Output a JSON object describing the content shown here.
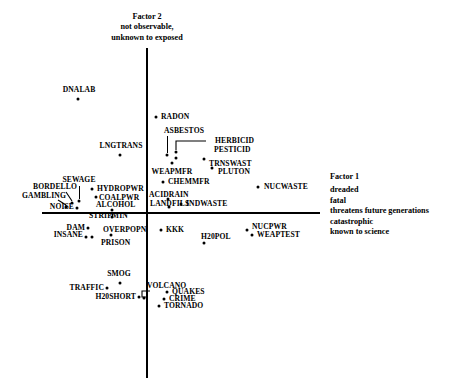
{
  "figure": {
    "type": "scatter",
    "background": "#ffffff",
    "point_color": "#000000",
    "axis_color": "#000000"
  },
  "axes": {
    "factor2": {
      "title": "Factor 2",
      "desc_line1": "not observable,",
      "desc_line2": "unknown to exposed",
      "orientation": "vertical",
      "x_px": 146,
      "y_top_px": 48,
      "y_bottom_px": 378
    },
    "factor1": {
      "title": "Factor 1",
      "desc_line1": "dreaded",
      "desc_line2": "fatal",
      "desc_line3": "threatens future generations",
      "desc_line4": "catastrophic",
      "desc_line5": "known to science",
      "orientation": "horizontal",
      "y_px": 212,
      "x_left_px": 42,
      "x_right_px": 320
    }
  },
  "chart_data": {
    "type": "scatter",
    "title": "",
    "subtitle": "",
    "xlabel": "Factor 1: dreaded, fatal, threatens future generations, catastrophic, known to science",
    "ylabel": "Factor 2: not observable, unknown to exposed",
    "grid": false,
    "legend": "none",
    "axis_origin_px": {
      "x": 146,
      "y": 212
    },
    "xlim_px": [
      42,
      320
    ],
    "ylim_px": [
      48,
      378
    ],
    "points": [
      {
        "label": "DNALAB",
        "px": 78,
        "py": 99,
        "lx": 79,
        "ly": 90,
        "anchor": "c",
        "leader": null
      },
      {
        "label": "RADON",
        "px": 156,
        "py": 117,
        "lx": 161,
        "ly": 117,
        "anchor": "l",
        "leader": null
      },
      {
        "label": "ASBESTOS",
        "px": 167,
        "py": 155,
        "lx": 184,
        "ly": 131,
        "anchor": "c",
        "leader": {
          "type": "v",
          "x": 167,
          "y1": 136,
          "y2": 153
        }
      },
      {
        "label": "HERBICID",
        "px": 176,
        "py": 152,
        "lx": 215,
        "ly": 141,
        "anchor": "l",
        "leader": {
          "type": "elbow-left",
          "x1": 206,
          "y1": 141,
          "x2": 176,
          "y2": 150
        }
      },
      {
        "label": "PESTICID",
        "px": 176,
        "py": 158,
        "lx": 214,
        "ly": 150,
        "anchor": "l",
        "leader": null
      },
      {
        "label": "LNGTRANS",
        "px": 120,
        "py": 155,
        "lx": 121,
        "ly": 146,
        "anchor": "c",
        "leader": null
      },
      {
        "label": "TRNSWAST",
        "px": 204,
        "py": 159,
        "lx": 209,
        "ly": 164,
        "anchor": "l",
        "leader": null
      },
      {
        "label": "WEAPMFR",
        "px": 172,
        "py": 163,
        "lx": 172,
        "ly": 172,
        "anchor": "c",
        "leader": null
      },
      {
        "label": "PLUTON",
        "px": 212,
        "py": 168,
        "lx": 218,
        "ly": 172,
        "anchor": "l",
        "leader": null
      },
      {
        "label": "CHEMMFR",
        "px": 163,
        "py": 182,
        "lx": 168,
        "ly": 182,
        "anchor": "l",
        "leader": null
      },
      {
        "label": "SEWAGE",
        "px": 79,
        "py": 201,
        "lx": 79,
        "ly": 180,
        "anchor": "c",
        "leader": {
          "type": "v",
          "x": 79,
          "y1": 186,
          "y2": 199
        }
      },
      {
        "label": "HYDROPWR",
        "px": 92,
        "py": 189,
        "lx": 97,
        "ly": 189,
        "anchor": "l",
        "leader": null
      },
      {
        "label": "BORDELLO",
        "px": 72,
        "py": 203,
        "lx": 55,
        "ly": 187,
        "anchor": "c",
        "leader": {
          "type": "diag",
          "x1": 66,
          "y1": 192,
          "x2": 72,
          "y2": 201
        }
      },
      {
        "label": "COALPWR",
        "px": 96,
        "py": 197,
        "lx": 99,
        "ly": 198,
        "anchor": "l",
        "leader": null
      },
      {
        "label": "ACIDRAIN",
        "px": 168,
        "py": 199,
        "lx": 149,
        "ly": 195,
        "anchor": "l",
        "leader": null
      },
      {
        "label": "NUCWASTE",
        "px": 258,
        "py": 187,
        "lx": 264,
        "ly": 187,
        "anchor": "l",
        "leader": null
      },
      {
        "label": "GAMBLING",
        "px": 66,
        "py": 207,
        "lx": 44,
        "ly": 196,
        "anchor": "c",
        "leader": {
          "type": "diag",
          "x1": 58,
          "y1": 200,
          "x2": 66,
          "y2": 205
        }
      },
      {
        "label": "NOISE",
        "px": 77,
        "py": 208,
        "lx": 74,
        "ly": 207,
        "anchor": "r",
        "leader": null
      },
      {
        "label": "ALCOHOL",
        "px": 112,
        "py": 210,
        "lx": 96,
        "ly": 205,
        "anchor": "l",
        "leader": null
      },
      {
        "label": "LANDFILS",
        "px": 169,
        "py": 207,
        "lx": 150,
        "ly": 204,
        "anchor": "l",
        "leader": null
      },
      {
        "label": "INDWASTE",
        "px": 181,
        "py": 204,
        "lx": 186,
        "ly": 204,
        "anchor": "l",
        "leader": null
      },
      {
        "label": "STRIPMIN",
        "px": 112,
        "py": 217,
        "lx": 89,
        "ly": 216,
        "anchor": "l",
        "leader": {
          "type": "v",
          "x": 112,
          "y1": 212,
          "y2": 216
        }
      },
      {
        "label": "DAM",
        "px": 88,
        "py": 228,
        "lx": 85,
        "ly": 228,
        "anchor": "r",
        "leader": null
      },
      {
        "label": "OVERPOPN",
        "px": 111,
        "py": 235,
        "lx": 103,
        "ly": 230,
        "anchor": "l",
        "leader": null
      },
      {
        "label": "KKK",
        "px": 161,
        "py": 230,
        "lx": 166,
        "ly": 230,
        "anchor": "l",
        "leader": null
      },
      {
        "label": "INSANE",
        "px": 86,
        "py": 237,
        "lx": 83,
        "ly": 235,
        "anchor": "r",
        "leader": null
      },
      {
        "label": "PRISON",
        "px": 92,
        "py": 237,
        "lx": 101,
        "ly": 243,
        "anchor": "l",
        "leader": null
      },
      {
        "label": "NUCPWR",
        "px": 247,
        "py": 230,
        "lx": 252,
        "ly": 227,
        "anchor": "l",
        "leader": null
      },
      {
        "label": "WEAPTEST",
        "px": 252,
        "py": 235,
        "lx": 257,
        "ly": 235,
        "anchor": "l",
        "leader": null
      },
      {
        "label": "H20POL",
        "px": 204,
        "py": 243,
        "lx": 201,
        "ly": 237,
        "anchor": "l",
        "leader": null
      },
      {
        "label": "SMOG",
        "px": 120,
        "py": 283,
        "lx": 119,
        "ly": 274,
        "anchor": "c",
        "leader": null
      },
      {
        "label": "TRAFFIC",
        "px": 107,
        "py": 288,
        "lx": 104,
        "ly": 288,
        "anchor": "r",
        "leader": null
      },
      {
        "label": "VOLCANO",
        "px": 144,
        "py": 298,
        "lx": 147,
        "ly": 286,
        "anchor": "l",
        "leader": {
          "type": "elbow-down",
          "x1": 150,
          "y1": 291,
          "x2": 146,
          "y2": 297
        }
      },
      {
        "label": "H20SHORT",
        "px": 139,
        "py": 297,
        "lx": 136,
        "ly": 297,
        "anchor": "r",
        "leader": null
      },
      {
        "label": "QUAKES",
        "px": 167,
        "py": 292,
        "lx": 172,
        "ly": 292,
        "anchor": "l",
        "leader": null
      },
      {
        "label": "CRIME",
        "px": 164,
        "py": 299,
        "lx": 169,
        "ly": 299,
        "anchor": "l",
        "leader": null
      },
      {
        "label": "TORNADO",
        "px": 159,
        "py": 306,
        "lx": 164,
        "ly": 306,
        "anchor": "l",
        "leader": null
      }
    ]
  }
}
